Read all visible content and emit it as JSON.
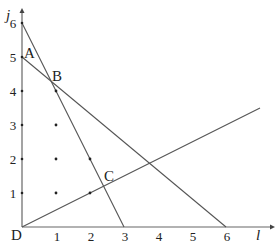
{
  "axes": {
    "x_label": "l",
    "y_label": "j",
    "x_ticks": [
      "1",
      "2",
      "3",
      "4",
      "5",
      "6"
    ],
    "y_ticks": [
      "1",
      "2",
      "3",
      "4",
      "5",
      "6"
    ]
  },
  "points": {
    "A": {
      "label": "A",
      "l": 0,
      "j": 5
    },
    "B": {
      "label": "B",
      "l": 0.857,
      "j": 4.286
    },
    "C": {
      "label": "C",
      "l": 2.4,
      "j": 1.2
    },
    "D": {
      "label": "D",
      "l": 0,
      "j": 0
    }
  },
  "lines": [
    {
      "name": "line-6-to-3",
      "from": [
        0,
        6
      ],
      "to": [
        3,
        0
      ]
    },
    {
      "name": "line-5-to-6",
      "from": [
        0,
        5
      ],
      "to": [
        6,
        0
      ]
    },
    {
      "name": "line-origin-half-slope",
      "from": [
        0,
        0
      ],
      "to": [
        7,
        3.5
      ]
    }
  ],
  "lattice_dots": [
    [
      1,
      1
    ],
    [
      1,
      2
    ],
    [
      1,
      3
    ],
    [
      1,
      4
    ],
    [
      2,
      1
    ],
    [
      2,
      2
    ]
  ],
  "colors": {
    "line": "#555555",
    "axis": "#666666",
    "text": "#222222"
  }
}
